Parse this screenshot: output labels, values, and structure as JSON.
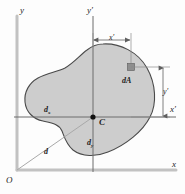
{
  "figure": {
    "colors": {
      "area_fill": "#cdcdcd",
      "area_stroke": "#4a4a4a",
      "axis_reference": "#b8b8b8",
      "axis_centroidal": "#6d6d6d",
      "element_fill": "#8e8e8e",
      "text": "#1d1d1d",
      "background": "#fdfdfd"
    }
  },
  "axes": {
    "reference_y_label": "y",
    "reference_x_label": "x",
    "centroidal_y_label": "y′",
    "centroidal_x_label": "x′",
    "origin_label": "O"
  },
  "points": {
    "centroid_label": "C",
    "element_label": "dA"
  },
  "dimensions": {
    "x_prime": "x′",
    "y_prime": "y′",
    "d_x": "d",
    "d_x_sub": "x",
    "d_y": "d",
    "d_y_sub": "y",
    "d": "d"
  },
  "geometry": {
    "origin": {
      "x": 17,
      "y": 170
    },
    "centroid": {
      "x": 93,
      "y": 117
    },
    "element": {
      "x": 131,
      "y": 67,
      "size": 7
    }
  }
}
